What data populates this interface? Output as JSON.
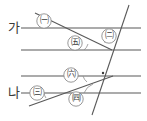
{
  "diagram": {
    "stroke_color": "#595959",
    "text_color": "#3a3a3a",
    "background": "#ffffff",
    "line_labels": [
      {
        "name": "line-label-ga",
        "text": "가",
        "x": 8,
        "y": 21
      },
      {
        "name": "line-label-na",
        "text": "나",
        "x": 8,
        "y": 86
      }
    ],
    "angle_labels": [
      {
        "name": "angle-label-1",
        "text": "㈠",
        "cx": 44,
        "cy": 21
      },
      {
        "name": "angle-label-2",
        "text": "㈡",
        "cx": 109,
        "cy": 36
      },
      {
        "name": "angle-label-5",
        "text": "㈤",
        "cx": 75,
        "cy": 43
      },
      {
        "name": "angle-label-6",
        "text": "㈥",
        "cx": 71,
        "cy": 75
      },
      {
        "name": "angle-label-3",
        "text": "㈢",
        "cx": 37,
        "cy": 93
      },
      {
        "name": "angle-label-4",
        "text": "㈣",
        "cx": 76,
        "cy": 99
      }
    ],
    "horizontal_lines": [
      {
        "name": "horizontal-line-1",
        "y": 28,
        "x1": 21,
        "x2": 141
      },
      {
        "name": "horizontal-line-2",
        "y": 50,
        "x1": 21,
        "x2": 141
      },
      {
        "name": "horizontal-line-3",
        "y": 76,
        "x1": 21,
        "x2": 141
      },
      {
        "name": "horizontal-line-4",
        "y": 93,
        "x1": 21,
        "x2": 141
      }
    ],
    "transversals": [
      {
        "name": "transversal-steep",
        "x1": 128,
        "y1": 6,
        "x2": 93,
        "y2": 114
      },
      {
        "name": "transversal-upper-slant",
        "x1": 36,
        "y1": 14,
        "x2": 111,
        "y2": 50
      },
      {
        "name": "transversal-lower-slant",
        "x1": 30,
        "y1": 105,
        "x2": 112,
        "y2": 76
      }
    ],
    "right_angle_mark": {
      "name": "right-angle-mark",
      "x": 103,
      "y": 73
    }
  }
}
